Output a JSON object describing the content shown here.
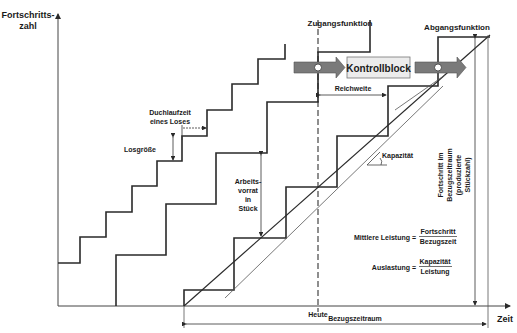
{
  "diagram": {
    "axes": {
      "y_label_line1": "Fortschritts-",
      "y_label_line2": "zahl",
      "x_label": "Zeit"
    },
    "labels": {
      "zugang": "Zugangsfunktion",
      "abgang": "Abgangsfunktion",
      "kontrollblock": "Kontrollblock",
      "reichweite": "Reichweite",
      "durchlaufzeit_line1": "Duchlaufzeit",
      "durchlaufzeit_line2": "eines Loses",
      "losgroesse": "Losgröße",
      "arbeitsvorrat_line1": "Arbeits-",
      "arbeitsvorrat_line2": "vorrat",
      "arbeitsvorrat_line3": "in",
      "arbeitsvorrat_line4": "Stück",
      "kapazitaet": "Kapazität",
      "heute": "Heute",
      "bezugszeitraum": "Bezugszeitraum",
      "fortschritt_line1": "Fortschritt im",
      "fortschritt_line2": "Bezugszeitraum",
      "fortschritt_line3": "(produzierte",
      "fortschritt_line4": "Stückzahl)"
    },
    "formulas": {
      "leistung_lhs": "Mittlere Leistung =",
      "leistung_num": "Fortschritt",
      "leistung_den": "Bezugszeit",
      "auslastung_lhs": "Auslastung =",
      "auslastung_num": "Kapazität",
      "auslastung_den": "Leistung"
    },
    "colors": {
      "line": "#2a2a2a",
      "arrow_fill": "#7a7a7a",
      "box_fill": "#ececec",
      "thin_line": "#555555"
    }
  }
}
